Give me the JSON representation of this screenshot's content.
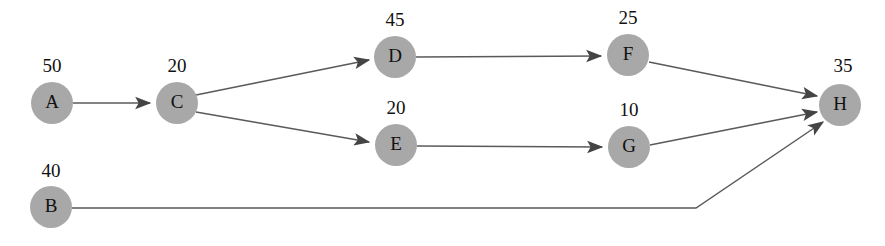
{
  "diagram": {
    "type": "directed-graph",
    "canvas": {
      "width": 885,
      "height": 246,
      "background": "#ffffff"
    },
    "style": {
      "node_fill": "#a8a8a8",
      "node_radius": 21,
      "edge_color": "#5a5a5a",
      "arrow_color": "#444444",
      "label_color": "#111111"
    },
    "nodes": [
      {
        "id": "A",
        "label": "A",
        "weight": "50",
        "cx": 52,
        "cy": 103,
        "wx": 52,
        "wy": 72
      },
      {
        "id": "B",
        "label": "B",
        "weight": "40",
        "cx": 51,
        "cy": 207,
        "wx": 51,
        "wy": 177
      },
      {
        "id": "C",
        "label": "C",
        "weight": "20",
        "cx": 177,
        "cy": 103,
        "wx": 177,
        "wy": 72
      },
      {
        "id": "D",
        "label": "D",
        "weight": "45",
        "cx": 395,
        "cy": 57,
        "wx": 395,
        "wy": 26
      },
      {
        "id": "E",
        "label": "E",
        "weight": "20",
        "cx": 396,
        "cy": 145,
        "wx": 396,
        "wy": 114
      },
      {
        "id": "F",
        "label": "F",
        "weight": "25",
        "cx": 628,
        "cy": 55,
        "wx": 628,
        "wy": 24
      },
      {
        "id": "G",
        "label": "G",
        "weight": "10",
        "cx": 629,
        "cy": 147,
        "wx": 629,
        "wy": 116
      },
      {
        "id": "H",
        "label": "H",
        "weight": "35",
        "cx": 840,
        "cy": 105,
        "wx": 843,
        "wy": 72
      }
    ],
    "edges": [
      {
        "id": "A-C",
        "from": "A",
        "to": "C",
        "points": "73,103 150,103"
      },
      {
        "id": "C-D",
        "from": "C",
        "to": "D",
        "points": "196,95 369,60"
      },
      {
        "id": "C-E",
        "from": "C",
        "to": "E",
        "points": "196,112 369,142"
      },
      {
        "id": "D-F",
        "from": "D",
        "to": "F",
        "points": "416,57 601,56"
      },
      {
        "id": "E-G",
        "from": "E",
        "to": "G",
        "points": "417,146 602,147"
      },
      {
        "id": "F-H",
        "from": "F",
        "to": "H",
        "points": "649,62 817,96"
      },
      {
        "id": "G-H",
        "from": "G",
        "to": "H",
        "points": "650,145 817,112"
      },
      {
        "id": "B-H",
        "from": "B",
        "to": "H",
        "points": "72,208 696,208 823,122"
      }
    ]
  }
}
